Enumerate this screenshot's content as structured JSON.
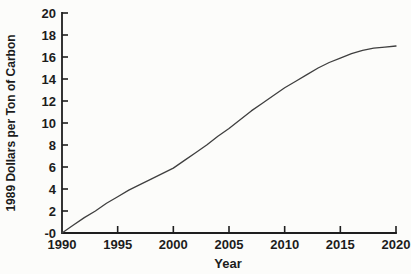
{
  "figure": {
    "background": "#fcfcfa",
    "ink_color": "#1e1e1e",
    "curve_color": "#3f3f3f"
  },
  "chart_data": {
    "type": "line",
    "title": "",
    "xlabel": "Year",
    "ylabel": "1989 Dollars per Ton of Carbon",
    "xlim": [
      1990,
      2020
    ],
    "ylim": [
      0,
      20
    ],
    "grid": false,
    "legend": "none",
    "x_tick_values": [
      1990,
      1995,
      2000,
      2005,
      2010,
      2015,
      2020
    ],
    "x_tick_labels": [
      "1990",
      "1995",
      "2000",
      "2005",
      "2010",
      "2015",
      "2020"
    ],
    "y_tick_values": [
      0,
      2,
      4,
      6,
      8,
      10,
      12,
      14,
      16,
      18,
      20
    ],
    "y_tick_labels": [
      "-0",
      "2",
      "4",
      "6",
      "8",
      "10",
      "12",
      "14",
      "16",
      "18",
      "20"
    ],
    "series": [
      {
        "name": "carbon-price-trajectory",
        "x": [
          1990,
          1991,
          1992,
          1993,
          1994,
          1995,
          1996,
          1997,
          1998,
          1999,
          2000,
          2001,
          2002,
          2003,
          2004,
          2005,
          2006,
          2007,
          2008,
          2009,
          2010,
          2011,
          2012,
          2013,
          2014,
          2015,
          2016,
          2017,
          2018,
          2019,
          2020
        ],
        "y": [
          0,
          0.7,
          1.4,
          2.0,
          2.7,
          3.3,
          3.9,
          4.4,
          4.9,
          5.4,
          5.9,
          6.6,
          7.3,
          8.0,
          8.8,
          9.5,
          10.3,
          11.1,
          11.8,
          12.5,
          13.2,
          13.8,
          14.4,
          15.0,
          15.5,
          15.9,
          16.3,
          16.6,
          16.8,
          16.9,
          17.0
        ]
      }
    ]
  }
}
